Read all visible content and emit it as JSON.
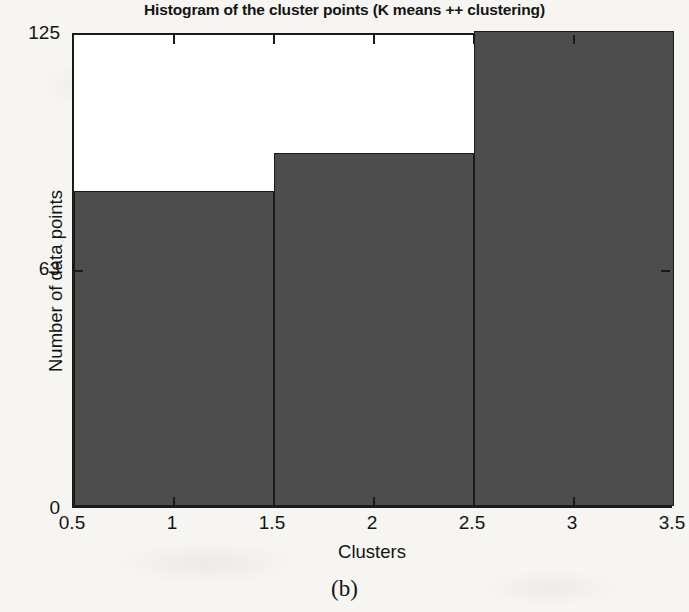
{
  "chart_data": {
    "type": "bar",
    "title": "Histogram of the cluster points (K means ++ clustering)",
    "xlabel": "Clusters",
    "ylabel": "Number of data points",
    "categories": [
      "1",
      "2",
      "3"
    ],
    "values": [
      83,
      93,
      125
    ],
    "bin_edges": [
      0.5,
      1.5,
      2.5,
      3.5
    ],
    "xlim": [
      0.5,
      3.5
    ],
    "ylim": [
      0,
      125
    ],
    "xticks": [
      "0.5",
      "1",
      "1.5",
      "2",
      "2.5",
      "3",
      "3.5"
    ],
    "xtick_values": [
      0.5,
      1,
      1.5,
      2,
      2.5,
      3,
      3.5
    ],
    "yticks": [
      "0",
      "63",
      "125"
    ],
    "ytick_values": [
      0,
      63,
      125
    ],
    "grid": false,
    "legend": "none",
    "bar_color": "#4d4d4d",
    "bar_edge_color": "#1b1b1b",
    "axes_color": "#1a1a1a",
    "background_color": "#ffffff"
  },
  "caption": {
    "text": "(b)"
  }
}
